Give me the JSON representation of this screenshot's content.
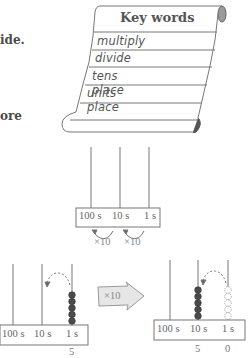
{
  "text_fragments": {
    "line1": "ide.",
    "line2": "ore"
  },
  "scroll": {
    "title": "Key words",
    "words": [
      "multiply",
      "divide",
      "tens place",
      "units place"
    ]
  },
  "abacus_top": {
    "labels": [
      "100 s",
      "10 s",
      "1 s"
    ],
    "arrows": [
      "×10",
      "×10"
    ]
  },
  "abacus_before": {
    "labels": [
      "100 s",
      "10 s",
      "1 s"
    ],
    "value_units": "5",
    "bead_count": 5
  },
  "transform_arrow": {
    "label": "×10",
    "fill": "#e6e6e6"
  },
  "abacus_after": {
    "labels": [
      "100 s",
      "10 s",
      "1 s"
    ],
    "value_tens": "5",
    "value_units": "0",
    "bead_count": 5
  },
  "colors": {
    "line": "#777777",
    "bead": "#4a4a4a",
    "text": "#555555"
  }
}
